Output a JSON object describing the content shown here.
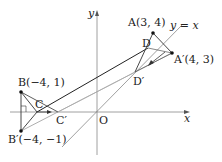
{
  "axes": {
    "x_label": "x",
    "y_label": "y",
    "origin_label": "O"
  },
  "line_label": "y = x",
  "points": {
    "A": {
      "label": "A(3, 4)",
      "x": 3,
      "y": 4
    },
    "A_prime": {
      "label": "A′(4, 3)",
      "x": 4,
      "y": 3
    },
    "B": {
      "label": "B(−4, 1)",
      "x": -4,
      "y": 1
    },
    "B_prime": {
      "label": "B′(−4, −1)",
      "x": -4,
      "y": -1
    },
    "C": {
      "label": "C"
    },
    "C_prime": {
      "label": "C′"
    },
    "D": {
      "label": "D"
    },
    "D_prime": {
      "label": "D′"
    }
  },
  "colors": {
    "axis": "#888888",
    "dark_line": "#222222",
    "light_line": "#999999"
  }
}
